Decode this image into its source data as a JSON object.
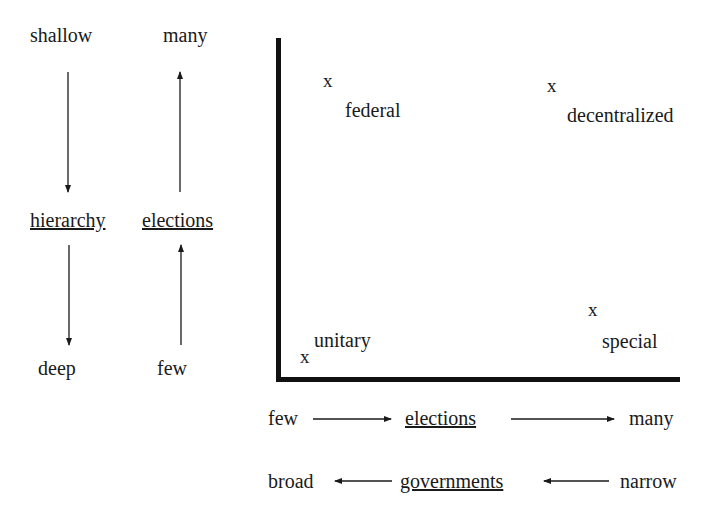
{
  "left_panel": {
    "hierarchy_column": {
      "top": "shallow",
      "middle": "hierarchy",
      "bottom": "deep",
      "arrows": [
        "down",
        "down"
      ]
    },
    "elections_column": {
      "top": "many",
      "middle": "elections",
      "bottom": "few",
      "arrows": [
        "up",
        "up"
      ]
    }
  },
  "plot": {
    "marker_symbol": "x",
    "points": [
      {
        "label": "federal",
        "quadrant": "top-left"
      },
      {
        "label": "decentralized",
        "quadrant": "top-right"
      },
      {
        "label": "unitary",
        "quadrant": "bottom-left"
      },
      {
        "label": "special",
        "quadrant": "bottom-right"
      }
    ]
  },
  "bottom_rows": {
    "elections_row": {
      "left": "few",
      "center": "elections",
      "right": "many",
      "direction": "right"
    },
    "governments_row": {
      "left": "broad",
      "center": "governments",
      "right": "narrow",
      "direction": "left"
    }
  },
  "colors": {
    "ink": "#1a1a1a",
    "background": "#ffffff"
  }
}
